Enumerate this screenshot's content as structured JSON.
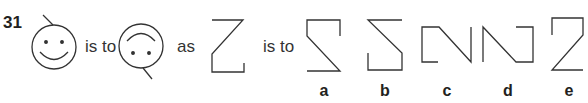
{
  "question": {
    "number": "31",
    "connector_1": "is to",
    "connector_2": "as",
    "connector_3": "is to"
  },
  "figures": {
    "first": "smiley-face-with-antenna-top-left",
    "second": "smiley-face-rotated-180-antenna-bottom-right",
    "third": "z-shape-with-lower-left-box"
  },
  "options": [
    {
      "label": "a",
      "shape": "s-shape-variant-a"
    },
    {
      "label": "b",
      "shape": "s-shape-variant-b"
    },
    {
      "label": "c",
      "shape": "n-shape-variant-c"
    },
    {
      "label": "d",
      "shape": "n-shape-variant-d"
    },
    {
      "label": "e",
      "shape": "z-shape-variant-e"
    }
  ],
  "colors": {
    "stroke": "#333333",
    "text": "#231f20"
  }
}
